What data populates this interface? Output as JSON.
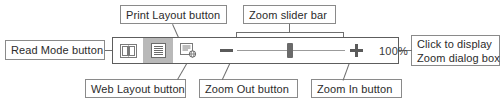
{
  "figure": {
    "line_color": "#6f6f6f",
    "box_border_color": "#8a8a8a",
    "selected_button_color": "#b9b9b9"
  },
  "toolbar": {
    "buttons": [
      {
        "id": "read-mode",
        "icon": "open-book-icon",
        "label": "Read Mode",
        "selected": false
      },
      {
        "id": "print-layout",
        "icon": "print-layout-icon",
        "label": "Print Layout",
        "selected": true
      },
      {
        "id": "web-layout",
        "icon": "web-layout-icon",
        "label": "Web Layout",
        "selected": false
      }
    ],
    "zoom_out": {
      "glyph": "−",
      "name": "zoom-out-button"
    },
    "zoom_in": {
      "glyph": "+",
      "name": "zoom-in-button"
    },
    "slider": {
      "name": "zoom-slider",
      "value": 100,
      "min": 10,
      "max": 500,
      "handle_percent": 46
    },
    "zoom_percent_label": "100%"
  },
  "callouts": {
    "read_mode": {
      "text": "Read Mode button"
    },
    "print_layout": {
      "text": "Print Layout button"
    },
    "web_layout": {
      "text": "Web Layout button"
    },
    "zoom_slider": {
      "text": "Zoom slider bar"
    },
    "zoom_out": {
      "text": "Zoom Out button"
    },
    "zoom_in": {
      "text": "Zoom In button"
    },
    "zoom_dialog": {
      "line1": "Click to display",
      "line2": "Zoom dialog box"
    }
  }
}
